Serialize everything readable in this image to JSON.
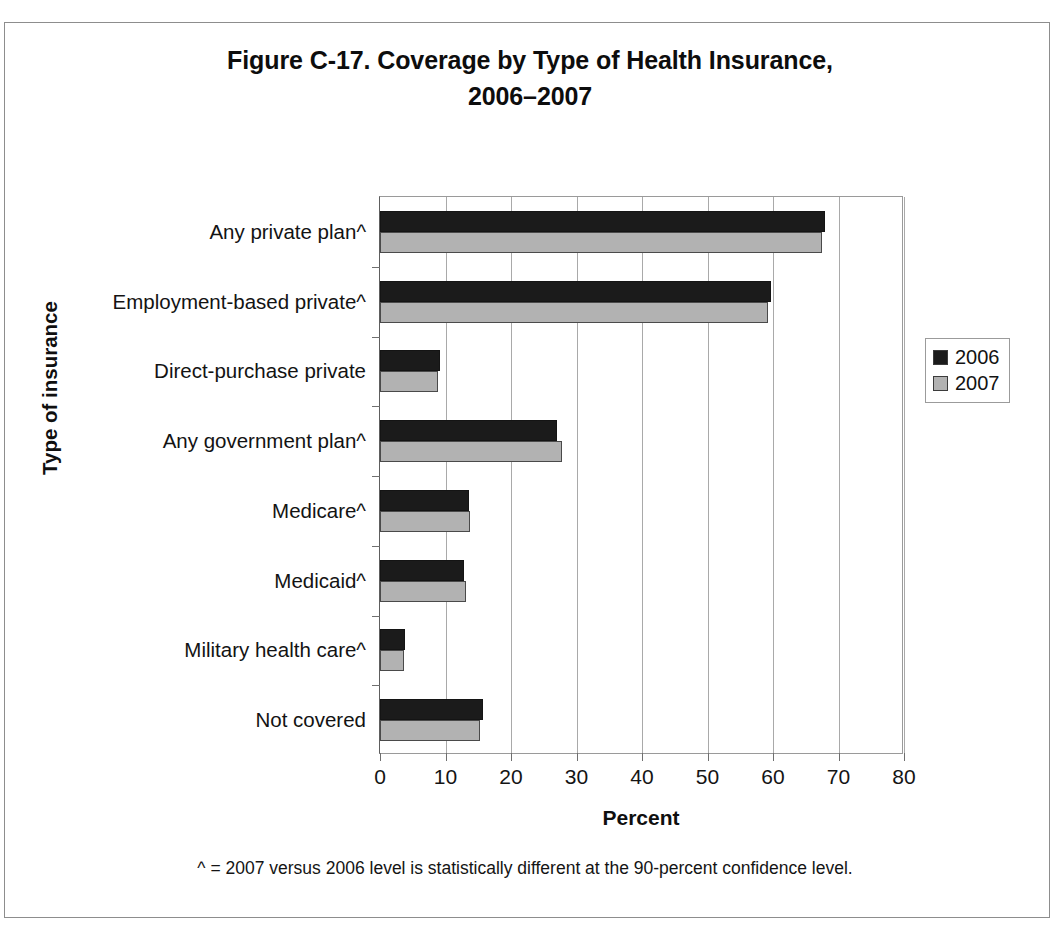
{
  "figure": {
    "title": "Figure C-17. Coverage by Type of Health Insurance, 2006–2007",
    "title_line1": "Figure C-17. Coverage by Type of Health Insurance,",
    "title_line2": "2006–2007",
    "footnote": "^ = 2007 versus 2006 level is statistically different at the 90-percent confidence level."
  },
  "axes": {
    "xlabel": "Percent",
    "ylabel": "Type of insurance",
    "xticks": [
      "0",
      "10",
      "20",
      "30",
      "40",
      "50",
      "60",
      "70",
      "80"
    ]
  },
  "legend": {
    "position": "right",
    "entries": [
      {
        "label": "2006",
        "color": "#1b1b1b",
        "icon": "legend-swatch-icon"
      },
      {
        "label": "2007",
        "color": "#b2b2b2",
        "icon": "legend-swatch-icon"
      }
    ]
  },
  "chart_data": {
    "type": "bar",
    "orientation": "horizontal",
    "title": "Figure C-17. Coverage by Type of Health Insurance, 2006–2007",
    "xlabel": "Percent",
    "ylabel": "Type of insurance",
    "xlim": [
      0,
      80
    ],
    "xticks": [
      0,
      10,
      20,
      30,
      40,
      50,
      60,
      70,
      80
    ],
    "grid": true,
    "legend_position": "right",
    "categories": [
      "Any private plan^",
      "Employment-based private^",
      "Direct-purchase private",
      "Any government plan^",
      "Medicare^",
      "Medicaid^",
      "Military health care^",
      "Not covered"
    ],
    "series": [
      {
        "name": "2006",
        "color": "#1b1b1b",
        "values": [
          67.9,
          59.7,
          9.1,
          27.0,
          13.6,
          12.9,
          3.8,
          15.8
        ]
      },
      {
        "name": "2007",
        "color": "#b2b2b2",
        "values": [
          67.5,
          59.3,
          8.9,
          27.8,
          13.8,
          13.2,
          3.7,
          15.3
        ]
      }
    ],
    "annotations": [
      "^ = 2007 versus 2006 level is statistically different at the 90-percent confidence level."
    ]
  }
}
